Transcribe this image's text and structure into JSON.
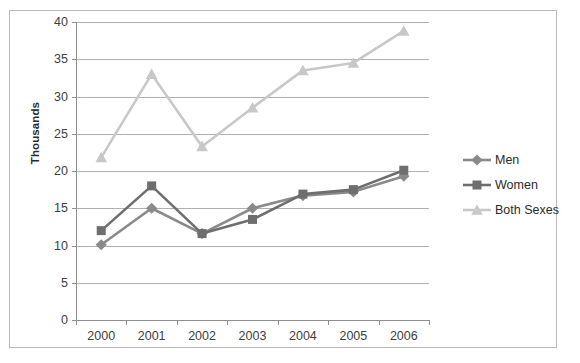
{
  "chart_data": {
    "type": "line",
    "title": "",
    "xlabel": "",
    "ylabel": "Thousands",
    "categories": [
      "2000",
      "2001",
      "2002",
      "2003",
      "2004",
      "2005",
      "2006"
    ],
    "x": [
      2000,
      2001,
      2002,
      2003,
      2004,
      2005,
      2006
    ],
    "series": [
      {
        "name": "Men",
        "color": "#8a8a8a",
        "marker": "diamond",
        "values": [
          10.1,
          15.0,
          11.6,
          15.0,
          16.7,
          17.2,
          19.3
        ]
      },
      {
        "name": "Women",
        "color": "#6e6e6e",
        "marker": "square",
        "values": [
          12.0,
          18.0,
          11.6,
          13.5,
          16.9,
          17.5,
          20.1
        ]
      },
      {
        "name": "Both Sexes",
        "color": "#c8c8c8",
        "marker": "triangle",
        "values": [
          21.8,
          33.0,
          23.3,
          28.5,
          33.5,
          34.5,
          38.8
        ]
      }
    ],
    "ylim": [
      0,
      40
    ],
    "ytick_values": [
      0,
      5,
      10,
      15,
      20,
      25,
      30,
      35,
      40
    ],
    "ytick_labels": [
      "0",
      "5",
      "10",
      "15",
      "20",
      "25",
      "30",
      "35",
      "40"
    ],
    "grid": true,
    "grid_axis": "y",
    "legend_position": "right",
    "legend_entries": [
      "Men",
      "Women",
      "Both Sexes"
    ],
    "background_color": "#ffffff",
    "gridline_color": "#b0b0b0",
    "border_color": "#b9b9b9"
  }
}
